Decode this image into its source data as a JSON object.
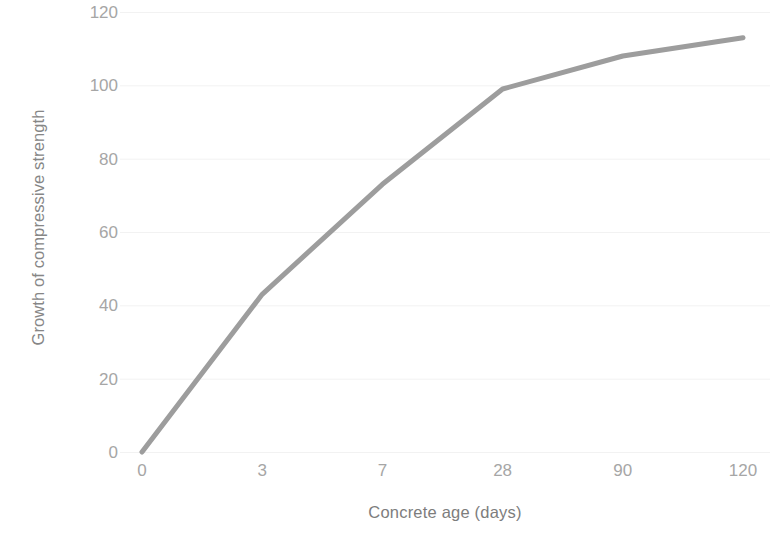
{
  "chart_data": {
    "type": "line",
    "title": "",
    "subtitle": "",
    "xlabel": "Concrete age (days)",
    "ylabel": "Growth of compressive strength",
    "categories": [
      "0",
      "3",
      "7",
      "28",
      "90",
      "120"
    ],
    "x_tick_labels": [
      "0",
      "3",
      "7",
      "28",
      "90",
      "120"
    ],
    "y_tick_labels": [
      "0",
      "20",
      "40",
      "60",
      "80",
      "100",
      "120"
    ],
    "ylim": [
      0,
      120
    ],
    "y_tick_step": 20,
    "grid": "horizontal",
    "legend": "none",
    "series": [
      {
        "name": "Growth of compressive strength",
        "color": "#9d9d9d",
        "values": [
          0,
          43,
          73,
          99,
          108,
          113
        ]
      }
    ],
    "annotations": []
  },
  "style": {
    "line_color": "#9d9d9d",
    "gridline_color": "#f2f2f2",
    "tick_label_color": "#a6a6a6",
    "axis_title_color": "#7d7d7d",
    "background_color": "#ffffff"
  }
}
